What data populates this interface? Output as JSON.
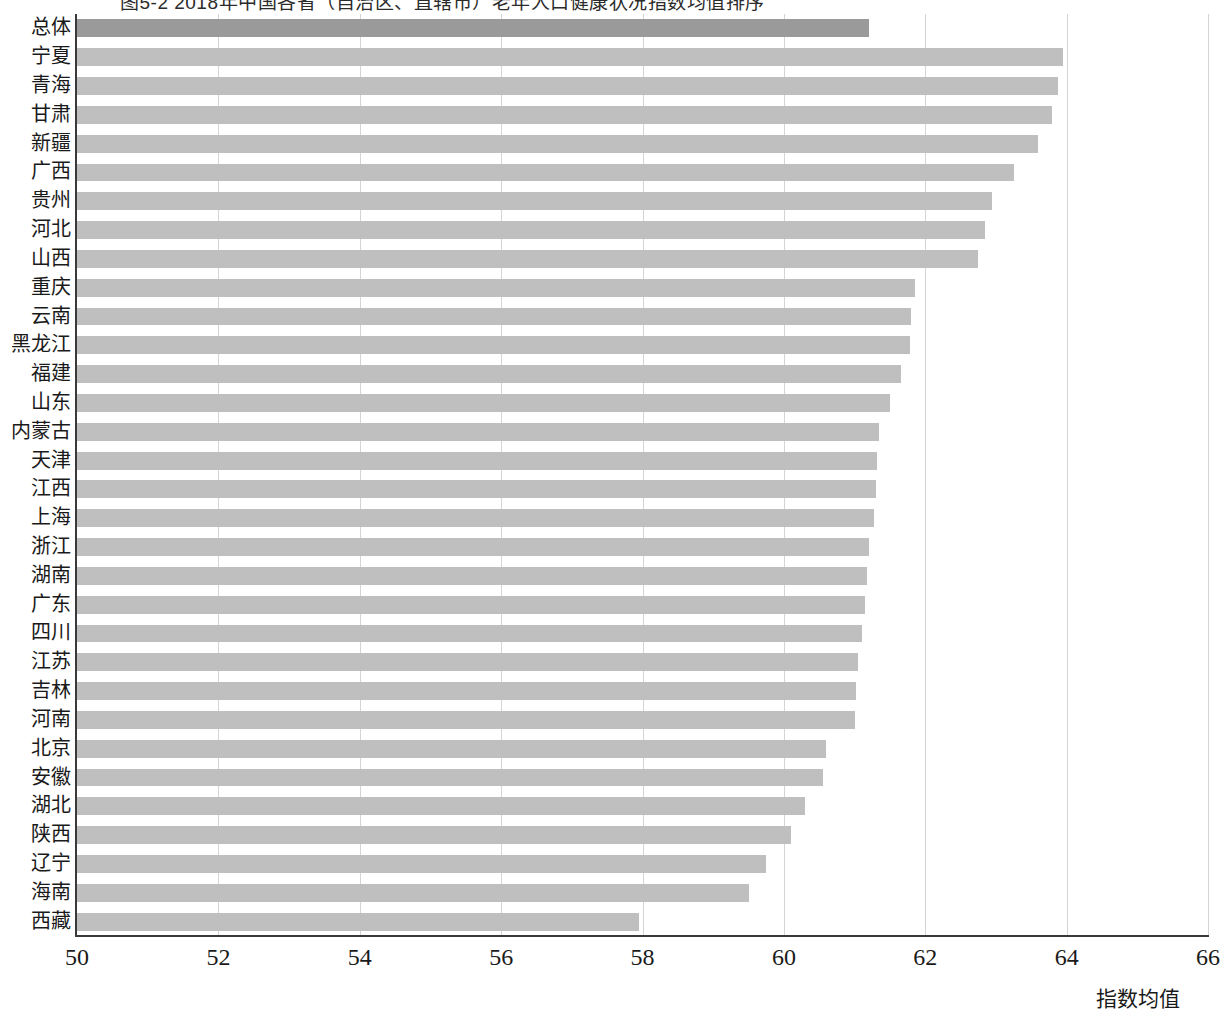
{
  "figure": {
    "clipped_title": "图5-2  2018年中国各省（自治区、直辖市）老年人口健康状况指数均值排序",
    "x_axis_title": "指数均值",
    "bar_color": "#bfbfbf",
    "highlight_color": "#9a9a9a",
    "gridline_color": "#d4d4d4",
    "axis_color": "#3a3a3a"
  },
  "chart_data": {
    "type": "bar",
    "orientation": "horizontal",
    "title": "",
    "xlabel": "指数均值",
    "ylabel": "",
    "xlim": [
      50,
      66
    ],
    "xticks": [
      50,
      52,
      54,
      56,
      58,
      60,
      62,
      64,
      66
    ],
    "grid": "vertical",
    "legend": "none",
    "highlight_category": "总体",
    "categories": [
      "总体",
      "宁夏",
      "青海",
      "甘肃",
      "新疆",
      "广西",
      "贵州",
      "河北",
      "山西",
      "重庆",
      "云南",
      "黑龙江",
      "福建",
      "山东",
      "内蒙古",
      "天津",
      "江西",
      "上海",
      "浙江",
      "湖南",
      "广东",
      "四川",
      "江苏",
      "吉林",
      "河南",
      "北京",
      "安徽",
      "湖北",
      "陕西",
      "辽宁",
      "海南",
      "西藏"
    ],
    "values": [
      61.2,
      63.95,
      63.88,
      63.8,
      63.6,
      63.25,
      62.95,
      62.85,
      62.75,
      61.85,
      61.8,
      61.78,
      61.65,
      61.5,
      61.35,
      61.32,
      61.3,
      61.28,
      61.2,
      61.18,
      61.15,
      61.1,
      61.05,
      61.02,
      61.0,
      60.6,
      60.55,
      60.3,
      60.1,
      59.75,
      59.5,
      57.95
    ]
  }
}
